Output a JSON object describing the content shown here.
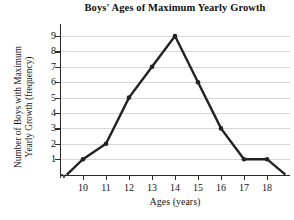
{
  "chart_data": {
    "type": "line",
    "title": "Boys' Ages of Maximum Yearly Growth",
    "xlabel": "Ages (years)",
    "ylabel_line1": "Number of Boys with Maximum",
    "ylabel_line2": "Yearly Growth (frequency)",
    "x": [
      10,
      11,
      12,
      13,
      14,
      15,
      16,
      17,
      18
    ],
    "values": [
      1,
      2,
      5,
      7,
      9,
      6,
      3,
      1,
      1
    ],
    "xtick_labels": [
      "10",
      "11",
      "12",
      "13",
      "14",
      "15",
      "16",
      "17",
      "18"
    ],
    "ytick_labels": [
      "1",
      "2",
      "3",
      "4",
      "5",
      "6",
      "7",
      "8",
      "9"
    ],
    "ylim": [
      0,
      9
    ],
    "xlim": [
      9.0,
      19.0
    ],
    "grid": true,
    "legend": "none",
    "markers": true,
    "series_color": "#222222",
    "grid_color": "#d7d7d7",
    "axis_color": "#2b2b2b",
    "axis_break": "y-axis-break-mark",
    "endpoints": [
      {
        "x": 9.3,
        "y": 0
      },
      {
        "x": 18.8,
        "y": 0
      }
    ]
  }
}
